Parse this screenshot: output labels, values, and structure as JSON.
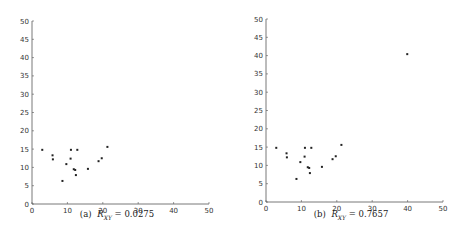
{
  "chart_data": [
    {
      "type": "scatter",
      "title": "",
      "caption": "(a) R_XY = 0.0275",
      "caption_label": "(a)",
      "caption_var": "R",
      "caption_sub": "XY",
      "caption_value": "= 0.0275",
      "xlabel": "",
      "ylabel": "",
      "xlim": [
        0,
        50
      ],
      "ylim": [
        0,
        50
      ],
      "xticks": [
        0,
        10,
        20,
        30,
        40,
        50
      ],
      "yticks": [
        0,
        5,
        10,
        15,
        20,
        25,
        30,
        35,
        40,
        45,
        50
      ],
      "grid": false,
      "legend": null,
      "marker_color": "#222222",
      "points": [
        {
          "x": 2.9,
          "y": 14.8
        },
        {
          "x": 5.8,
          "y": 13.3
        },
        {
          "x": 5.9,
          "y": 12.2
        },
        {
          "x": 8.6,
          "y": 6.3
        },
        {
          "x": 9.7,
          "y": 10.9
        },
        {
          "x": 10.9,
          "y": 12.4
        },
        {
          "x": 11.0,
          "y": 14.8
        },
        {
          "x": 11.8,
          "y": 9.5
        },
        {
          "x": 12.2,
          "y": 9.3
        },
        {
          "x": 12.4,
          "y": 7.9
        },
        {
          "x": 12.8,
          "y": 14.8
        },
        {
          "x": 15.8,
          "y": 9.6
        },
        {
          "x": 18.8,
          "y": 11.7
        },
        {
          "x": 19.7,
          "y": 12.5
        },
        {
          "x": 21.3,
          "y": 15.6
        }
      ]
    },
    {
      "type": "scatter",
      "title": "",
      "caption": "(b) R_XY = 0.7657",
      "caption_label": "(b)",
      "caption_var": "R",
      "caption_sub": "XY",
      "caption_value": "= 0.7657",
      "xlabel": "",
      "ylabel": "",
      "xlim": [
        0,
        50
      ],
      "ylim": [
        0,
        50
      ],
      "xticks": [
        0,
        10,
        20,
        30,
        40,
        50
      ],
      "yticks": [
        0,
        5,
        10,
        15,
        20,
        25,
        30,
        35,
        40,
        45,
        50
      ],
      "grid": false,
      "legend": null,
      "marker_color": "#222222",
      "points": [
        {
          "x": 2.9,
          "y": 14.8
        },
        {
          "x": 5.8,
          "y": 13.3
        },
        {
          "x": 5.9,
          "y": 12.2
        },
        {
          "x": 8.6,
          "y": 6.3
        },
        {
          "x": 9.7,
          "y": 10.9
        },
        {
          "x": 10.9,
          "y": 12.4
        },
        {
          "x": 11.0,
          "y": 14.8
        },
        {
          "x": 11.8,
          "y": 9.5
        },
        {
          "x": 12.2,
          "y": 9.3
        },
        {
          "x": 12.4,
          "y": 7.9
        },
        {
          "x": 12.8,
          "y": 14.8
        },
        {
          "x": 15.8,
          "y": 9.6
        },
        {
          "x": 18.8,
          "y": 11.7
        },
        {
          "x": 19.7,
          "y": 12.5
        },
        {
          "x": 21.3,
          "y": 15.6
        },
        {
          "x": 39.9,
          "y": 40.4
        }
      ]
    }
  ]
}
